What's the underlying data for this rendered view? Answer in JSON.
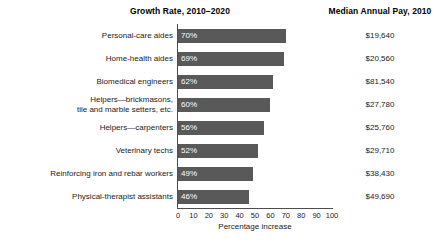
{
  "headers": {
    "growth": "Growth Rate, 2010–2020",
    "pay": "Median Annual Pay, 2010"
  },
  "axis": {
    "x_title": "Percentage increase",
    "ticks": [
      "0",
      "10",
      "20",
      "30",
      "40",
      "50",
      "60",
      "70",
      "80",
      "90",
      "100"
    ]
  },
  "colors": {
    "bar": "#595959",
    "bar_value_text": "#ffffff",
    "axis": "#4d4d4d",
    "background": "#ffffff",
    "text": "#1a1a1a"
  },
  "chart_data": {
    "type": "bar",
    "orientation": "horizontal",
    "title": "Growth Rate, 2010–2020",
    "xlabel": "Percentage increase",
    "ylabel": "",
    "xlim": [
      0,
      100
    ],
    "xticks": [
      0,
      10,
      20,
      30,
      40,
      50,
      60,
      70,
      80,
      90,
      100
    ],
    "grid": false,
    "legend": "none",
    "categories": [
      "Personal-care aides",
      "Home-health aides",
      "Biomedical engineers",
      "Helpers—brickmasons, tile and marble setters, etc.",
      "Helpers—carpenters",
      "Veterinary techs",
      "Reinforcing iron and rebar workers",
      "Physical-therapist assistants"
    ],
    "values": [
      70,
      69,
      62,
      60,
      56,
      52,
      49,
      46
    ],
    "value_labels": [
      "70%",
      "69%",
      "62%",
      "60%",
      "56%",
      "52%",
      "49%",
      "46%"
    ],
    "secondary_column": {
      "name": "Median Annual Pay, 2010",
      "values": [
        "$19,640",
        "$20,560",
        "$81,540",
        "$27,780",
        "$25,760",
        "$29,710",
        "$38,430",
        "$49,690"
      ]
    }
  },
  "rows": [
    {
      "label_line1": "Personal-care aides",
      "label_line2": "",
      "value": 70,
      "value_label": "70%",
      "pay": "$19,640"
    },
    {
      "label_line1": "Home-health aides",
      "label_line2": "",
      "value": 69,
      "value_label": "69%",
      "pay": "$20,560"
    },
    {
      "label_line1": "Biomedical engineers",
      "label_line2": "",
      "value": 62,
      "value_label": "62%",
      "pay": "$81,540"
    },
    {
      "label_line1": "Helpers—brickmasons,",
      "label_line2": "tile and marble setters, etc.",
      "value": 60,
      "value_label": "60%",
      "pay": "$27,780"
    },
    {
      "label_line1": "Helpers—carpenters",
      "label_line2": "",
      "value": 56,
      "value_label": "56%",
      "pay": "$25,760"
    },
    {
      "label_line1": "Veterinary techs",
      "label_line2": "",
      "value": 52,
      "value_label": "52%",
      "pay": "$29,710"
    },
    {
      "label_line1": "Reinforcing iron and rebar workers",
      "label_line2": "",
      "value": 49,
      "value_label": "49%",
      "pay": "$38,430"
    },
    {
      "label_line1": "Physical-therapist assistants",
      "label_line2": "",
      "value": 46,
      "value_label": "46%",
      "pay": "$49,690"
    }
  ]
}
